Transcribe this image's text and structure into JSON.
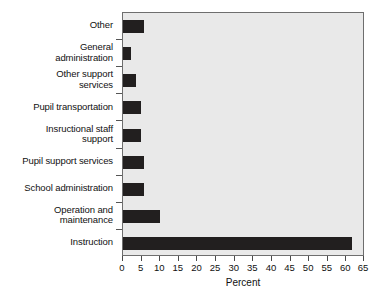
{
  "chart_data": {
    "type": "bar",
    "orientation": "horizontal",
    "title": "",
    "xlabel": "Percent",
    "ylabel": "",
    "xlim": [
      0,
      65
    ],
    "xticks": [
      0,
      5,
      10,
      15,
      20,
      25,
      30,
      35,
      40,
      45,
      50,
      55,
      60,
      65
    ],
    "grid": false,
    "legend": null,
    "plot_background": "#e9e9e9",
    "bar_color": "#221f1f",
    "categories": [
      "Other",
      "General administration",
      "Other support services",
      "Pupil transportation",
      "Insructional staff support",
      "Pupil support services",
      "School administration",
      "Operation and maintenance",
      "Instruction"
    ],
    "values": [
      5.6,
      2.2,
      3.5,
      4.8,
      4.9,
      5.7,
      5.7,
      10.0,
      61.6
    ]
  },
  "axis": {
    "x_title": "Percent",
    "tick_labels": [
      "0",
      "5",
      "10",
      "15",
      "20",
      "25",
      "30",
      "35",
      "40",
      "45",
      "50",
      "55",
      "60",
      "65"
    ]
  },
  "categories": [
    {
      "line1": "Other",
      "line2": ""
    },
    {
      "line1": "General",
      "line2": "administration"
    },
    {
      "line1": "Other support",
      "line2": "services"
    },
    {
      "line1": "Pupil transportation",
      "line2": ""
    },
    {
      "line1": "Insructional staff",
      "line2": "support"
    },
    {
      "line1": "Pupil support services",
      "line2": ""
    },
    {
      "line1": "School administration",
      "line2": ""
    },
    {
      "line1": "Operation and",
      "line2": "maintenance"
    },
    {
      "line1": "Instruction",
      "line2": ""
    }
  ]
}
